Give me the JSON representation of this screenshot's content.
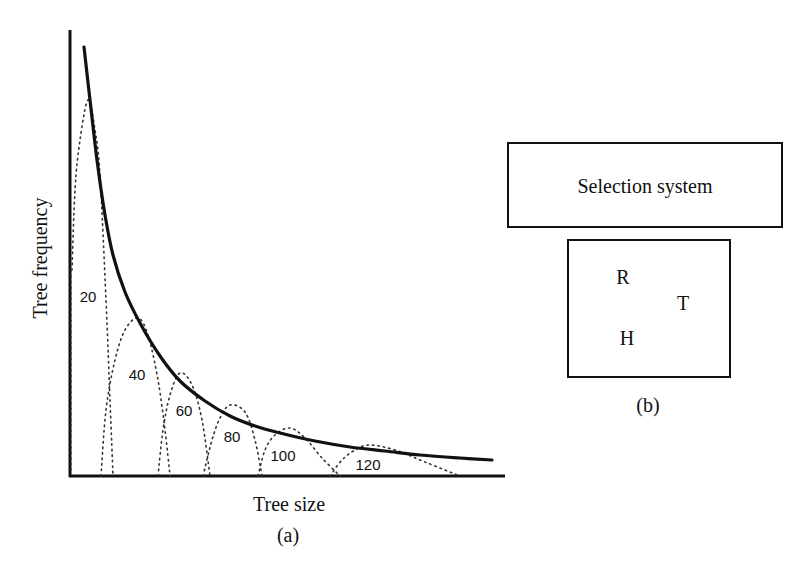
{
  "panel_a": {
    "caption": "(a)",
    "xlabel": "Tree size",
    "ylabel": "Tree frequency",
    "axes": {
      "x0": 70,
      "y0": 476,
      "x1": 505,
      "ytop": 30
    },
    "envelope_curve": [
      [
        84,
        47
      ],
      [
        90,
        100
      ],
      [
        97,
        160
      ],
      [
        105,
        215
      ],
      [
        113,
        255
      ],
      [
        125,
        292
      ],
      [
        140,
        323
      ],
      [
        160,
        356
      ],
      [
        180,
        381
      ],
      [
        205,
        401
      ],
      [
        230,
        416
      ],
      [
        255,
        426
      ],
      [
        280,
        433
      ],
      [
        315,
        441
      ],
      [
        350,
        447
      ],
      [
        385,
        451
      ],
      [
        420,
        455
      ],
      [
        460,
        458
      ],
      [
        492,
        460
      ]
    ],
    "humps": [
      {
        "label": "20",
        "path": [
          [
            72,
            270
          ],
          [
            75,
            190
          ],
          [
            80,
            140
          ],
          [
            88,
            100
          ],
          [
            95,
            130
          ],
          [
            100,
            175
          ],
          [
            106,
            300
          ],
          [
            110,
            400
          ],
          [
            113,
            476
          ]
        ],
        "label_pos": [
          88,
          302
        ],
        "left_base": [
          [
            71,
            470
          ],
          [
            71,
            270
          ]
        ]
      },
      {
        "label": "40",
        "path": [
          [
            101,
            476
          ],
          [
            106,
            410
          ],
          [
            115,
            360
          ],
          [
            125,
            330
          ],
          [
            138,
            318
          ],
          [
            148,
            335
          ],
          [
            158,
            380
          ],
          [
            165,
            430
          ],
          [
            170,
            476
          ]
        ],
        "label_pos": [
          137,
          380
        ]
      },
      {
        "label": "60",
        "path": [
          [
            158,
            476
          ],
          [
            163,
            430
          ],
          [
            170,
            395
          ],
          [
            180,
            373
          ],
          [
            192,
            385
          ],
          [
            202,
            420
          ],
          [
            210,
            476
          ]
        ],
        "label_pos": [
          184,
          416
        ]
      },
      {
        "label": "80",
        "path": [
          [
            203,
            476
          ],
          [
            212,
            440
          ],
          [
            220,
            418
          ],
          [
            230,
            405
          ],
          [
            245,
            412
          ],
          [
            255,
            440
          ],
          [
            262,
            476
          ]
        ],
        "label_pos": [
          232,
          442
        ]
      },
      {
        "label": "100",
        "path": [
          [
            258,
            476
          ],
          [
            265,
            450
          ],
          [
            275,
            435
          ],
          [
            290,
            428
          ],
          [
            305,
            438
          ],
          [
            322,
            458
          ],
          [
            340,
            476
          ]
        ],
        "label_pos": [
          283,
          461
        ]
      },
      {
        "label": "120",
        "path": [
          [
            330,
            476
          ],
          [
            342,
            460
          ],
          [
            355,
            450
          ],
          [
            370,
            445
          ],
          [
            395,
            450
          ],
          [
            425,
            462
          ],
          [
            460,
            476
          ]
        ],
        "label_pos": [
          368,
          470
        ]
      }
    ]
  },
  "panel_b": {
    "caption": "(b)",
    "selection_box_label": "Selection system",
    "inner_letters": [
      {
        "text": "R",
        "x": 623,
        "y": 284
      },
      {
        "text": "T",
        "x": 683,
        "y": 310
      },
      {
        "text": "H",
        "x": 627,
        "y": 345
      }
    ]
  },
  "chart_data": {
    "type": "line",
    "title": "",
    "xlabel": "Tree size",
    "ylabel": "Tree frequency",
    "series": [
      {
        "name": "envelope (overall tree frequency)",
        "style": "solid",
        "shape": "decreasing hyperbolic curve"
      },
      {
        "name": "20",
        "style": "dotted",
        "shape": "hump"
      },
      {
        "name": "40",
        "style": "dotted",
        "shape": "hump"
      },
      {
        "name": "60",
        "style": "dotted",
        "shape": "hump"
      },
      {
        "name": "80",
        "style": "dotted",
        "shape": "hump"
      },
      {
        "name": "100",
        "style": "dotted",
        "shape": "hump"
      },
      {
        "name": "120",
        "style": "dotted",
        "shape": "hump"
      }
    ],
    "annotations": [
      "20",
      "40",
      "60",
      "80",
      "100",
      "120"
    ],
    "grid": false,
    "ticks": false
  }
}
